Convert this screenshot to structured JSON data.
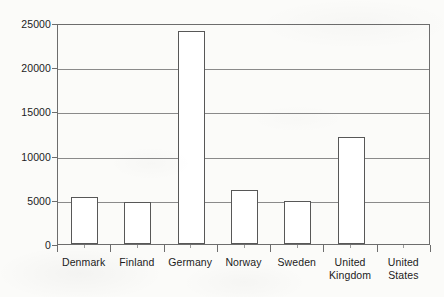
{
  "chart_data": {
    "type": "bar",
    "title": "",
    "subtitle": "",
    "xlabel": "",
    "ylabel": "",
    "categories": [
      "Denmark",
      "Finland",
      "Germany",
      "Norway",
      "Sweden",
      "United\nKingdom",
      "United\nStates"
    ],
    "values": [
      5300,
      4700,
      24100,
      6100,
      4900,
      12100,
      0
    ],
    "ylim": [
      0,
      25000
    ],
    "yticks": [
      0,
      5000,
      10000,
      15000,
      20000,
      25000
    ],
    "ytick_labels": [
      "0",
      "5000",
      "10000",
      "15000",
      "20000",
      "25000"
    ],
    "grid": "horizontal",
    "legend": "none",
    "bar_fill_color": "#ffffff",
    "bar_edge_color": "#575757",
    "gridline_color": "#8a8a8a",
    "axis_color": "#6d6d6d",
    "background_color": "#fbfbf9",
    "text_color": "#1c1c1c"
  }
}
